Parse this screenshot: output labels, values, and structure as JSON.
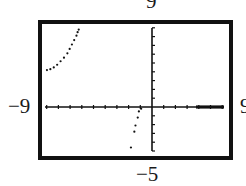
{
  "window_labels": {
    "ymax": "9",
    "xmin": "−9",
    "xmax": "9",
    "ymin": "−5"
  },
  "chart_data": {
    "type": "scatter",
    "title": "",
    "xlabel": "",
    "ylabel": "",
    "xlim": [
      -9,
      9
    ],
    "ylim": [
      -5,
      9
    ],
    "grid": false,
    "axis_ticks": "unit ticks on both axes",
    "series": [
      {
        "name": "left branch (upper)",
        "x": [
          -9.3,
          -9.0,
          -8.7,
          -8.4,
          -8.1,
          -7.8,
          -7.5,
          -7.3,
          -7.1,
          -6.9,
          -6.7,
          -6.6,
          -6.5
        ],
        "y": [
          4.2,
          4.3,
          4.5,
          4.8,
          5.2,
          5.6,
          6.1,
          6.6,
          7.1,
          7.6,
          8.1,
          8.5,
          8.8
        ]
      },
      {
        "name": "right branch (lower)",
        "x": [
          -1.0,
          -1.2,
          -1.3,
          -1.5,
          -1.6,
          -1.9
        ],
        "y": [
          -0.2,
          -0.5,
          -1.2,
          -2.1,
          -2.8,
          -4.6
        ]
      }
    ]
  }
}
